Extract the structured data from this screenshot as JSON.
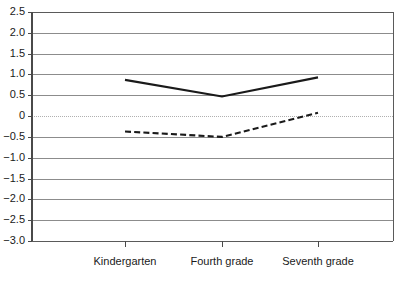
{
  "chart_data": {
    "type": "line",
    "title": "",
    "subtitle": "",
    "xlabel": "",
    "ylabel": "",
    "categories": [
      "Kindergarten",
      "Fourth grade",
      "Seventh grade"
    ],
    "series": [
      {
        "name": "solid-line",
        "style": "solid",
        "color": "#1a1a1a",
        "values": [
          0.87,
          0.47,
          0.93
        ]
      },
      {
        "name": "dashed-line",
        "style": "dashed",
        "color": "#1a1a1a",
        "values": [
          -0.37,
          -0.5,
          0.08
        ]
      }
    ],
    "ylim": [
      -3.0,
      2.5
    ],
    "ytick_values": [
      2.5,
      2.0,
      1.5,
      1.0,
      0.5,
      0,
      -0.5,
      -1.0,
      -1.5,
      -2.0,
      -2.5,
      -3.0
    ],
    "ytick_labels": [
      "2.5",
      "2.0",
      "1.5",
      "1.0",
      "0.5",
      "0",
      "−0.5",
      "−1.0",
      "−1.5",
      "−2.0",
      "−2.5",
      "−3.0"
    ],
    "grid": true,
    "grid_color": "#8c8c8c",
    "zero_line_color": "#b0b0b0",
    "legend": "none",
    "legend_entries": []
  },
  "geometry": {
    "plot_left": 32,
    "plot_right": 393,
    "plot_top": 12,
    "plot_bottom": 241,
    "x_positions": [
      125,
      222,
      318
    ],
    "xtick_label_y": 262
  }
}
